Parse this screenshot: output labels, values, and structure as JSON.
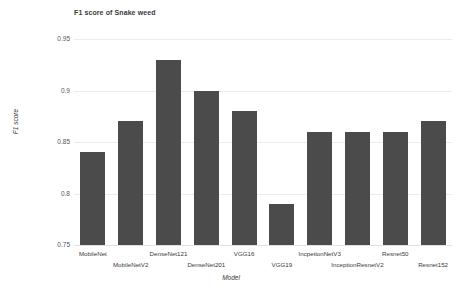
{
  "chart_data": {
    "type": "bar",
    "title": "F1 score of Snake weed",
    "xlabel": "Model",
    "ylabel": "F1 score",
    "categories": [
      "MobileNet",
      "MobileNetV2",
      "DenseNet121",
      "DenseNet201",
      "VGG16",
      "VGG19",
      "IncpetionNetV3",
      "InceptionResnetV2",
      "Resnet50",
      "Resnet152"
    ],
    "values": [
      0.84,
      0.87,
      0.93,
      0.9,
      0.88,
      0.79,
      0.86,
      0.86,
      0.86,
      0.87
    ],
    "ylim": [
      0.75,
      0.95
    ],
    "yticks": [
      "0.75",
      "0.8",
      "0.85",
      "0.9",
      "0.95"
    ],
    "ytick_values": [
      0.75,
      0.8,
      0.85,
      0.9,
      0.95
    ],
    "grid": true,
    "legend": "none",
    "bar_color": "#4b4b4b",
    "grid_color": "#ececec",
    "background_color": "#ffffff"
  }
}
